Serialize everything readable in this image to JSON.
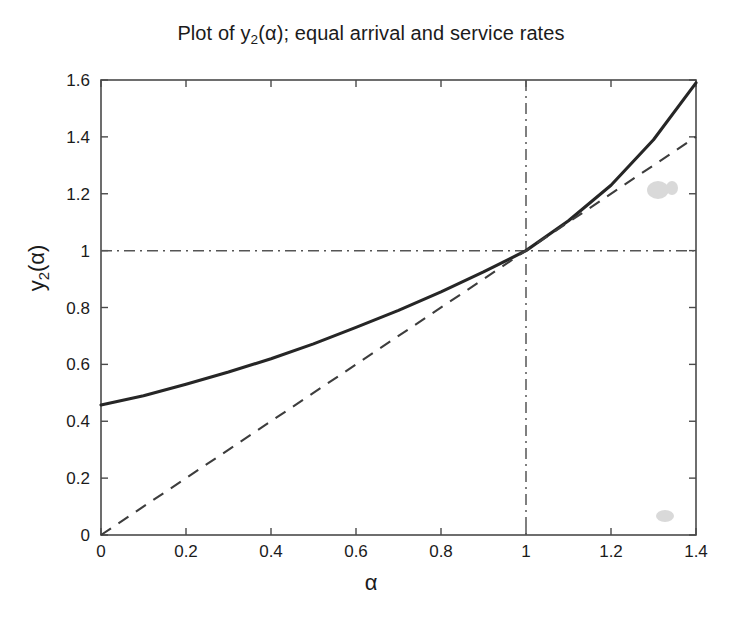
{
  "figure": {
    "title_prefix": "Plot of y",
    "title_sub": "2",
    "title_suffix": "(α); equal arrival and service rates",
    "title_full": "Plot of y2(α); equal arrival and service rates",
    "background_color": "#ffffff",
    "foreground_color": "#1b1b1b"
  },
  "axes": {
    "y_label_prefix": "y",
    "y_label_sub": "2",
    "y_label_suffix": "(α)",
    "x_label": "α",
    "x_ticks": [
      "0",
      "0.2",
      "0.4",
      "0.6",
      "0.8",
      "1",
      "1.2",
      "1.4"
    ],
    "y_ticks": [
      "0",
      "0.2",
      "0.4",
      "0.6",
      "0.8",
      "1",
      "1.2",
      "1.4",
      "1.6"
    ]
  },
  "chart_data": {
    "type": "line",
    "title": "Plot of y2(α); equal arrival and service rates",
    "xlabel": "α",
    "ylabel": "y2(α)",
    "xlim": [
      0,
      1.4
    ],
    "ylim": [
      0,
      1.6
    ],
    "xticks": [
      0,
      0.2,
      0.4,
      0.6,
      0.8,
      1.0,
      1.2,
      1.4
    ],
    "yticks": [
      0,
      0.2,
      0.4,
      0.6,
      0.8,
      1.0,
      1.2,
      1.4,
      1.6
    ],
    "grid": false,
    "legend": null,
    "series": [
      {
        "name": "y2(alpha)",
        "style": "solid",
        "color": "#262626",
        "x": [
          0,
          0.1,
          0.2,
          0.3,
          0.4,
          0.5,
          0.6,
          0.7,
          0.8,
          0.9,
          1.0,
          1.1,
          1.2,
          1.3,
          1.4
        ],
        "values": [
          0.457,
          0.49,
          0.53,
          0.573,
          0.62,
          0.672,
          0.73,
          0.79,
          0.855,
          0.925,
          1.0,
          1.105,
          1.23,
          1.39,
          1.59
        ]
      },
      {
        "name": "identity y = alpha",
        "style": "dashed",
        "color": "#3d3d3d",
        "x": [
          0,
          1.4
        ],
        "values": [
          0,
          1.4
        ]
      }
    ],
    "reference_lines": [
      {
        "name": "horizontal-reference-y1",
        "orientation": "horizontal",
        "value": 1.0,
        "style": "dash-dot",
        "color": "#555555"
      },
      {
        "name": "vertical-reference-x1",
        "orientation": "vertical",
        "value": 1.0,
        "style": "dash-dot",
        "color": "#555555"
      }
    ],
    "annotations": [
      {
        "name": "fixed-point",
        "x": 1.0,
        "y": 1.0,
        "note": "curve crosses identity line"
      }
    ]
  }
}
